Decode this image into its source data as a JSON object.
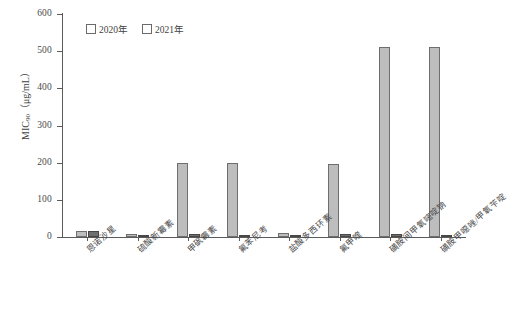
{
  "chart_data": {
    "type": "bar",
    "title": "",
    "xlabel": "",
    "ylabel": "MIC90 (μg/mL)",
    "ylabel_base": "MIC",
    "ylabel_sub": "90",
    "ylabel_unit": "（μg/mL）",
    "ylim": [
      0,
      600
    ],
    "ytick_step": 100,
    "yticks": [
      0,
      100,
      200,
      300,
      400,
      500,
      600
    ],
    "ytick_labels": [
      "0",
      "100",
      "200",
      "300",
      "400",
      "500",
      "600"
    ],
    "grid": false,
    "legend_position": "top-left-inside",
    "categories": [
      "恩诺沙星",
      "硫酸新霉素",
      "甲砜霉素",
      "氟苯尼考",
      "盐酸多西环素",
      "氟甲喹",
      "磺胺间甲氧嘧啶钠",
      "磺胺甲噁唑/甲氧苄啶"
    ],
    "series": [
      {
        "name": "2020年",
        "color": "#bdbdbd",
        "values": [
          16,
          8,
          200,
          200,
          12,
          196,
          512,
          512
        ]
      },
      {
        "name": "2021年",
        "color": "#6f6f6f",
        "values": [
          16,
          2,
          8,
          4,
          4,
          8,
          8,
          6
        ]
      }
    ]
  }
}
